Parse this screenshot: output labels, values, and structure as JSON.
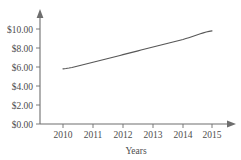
{
  "chart_data": {
    "type": "line",
    "title": "",
    "subtitle": "",
    "xlabel": "Years",
    "ylabel": "",
    "categories": [
      "2010",
      "2011",
      "2012",
      "2013",
      "2014",
      "2015"
    ],
    "x": [
      2010,
      2011,
      2012,
      2013,
      2014,
      2015
    ],
    "values": [
      5.8,
      6.5,
      7.3,
      8.1,
      8.9,
      9.8
    ],
    "series": [
      {
        "name": "Price",
        "values": [
          5.8,
          6.5,
          7.3,
          8.1,
          8.9,
          9.8
        ]
      }
    ],
    "ylim": [
      0,
      10
    ],
    "xlim": [
      2010,
      2015
    ],
    "y_ticks": [
      0,
      2,
      4,
      6,
      8,
      10
    ],
    "y_tick_labels": [
      "$0.00",
      "$2.00",
      "$4.00",
      "$6.00",
      "$8.00",
      "$10.00"
    ],
    "x_ticks": [
      2010,
      2011,
      2012,
      2013,
      2014,
      2015
    ],
    "x_tick_labels": [
      "2010",
      "2011",
      "2012",
      "2013",
      "2014",
      "2015"
    ],
    "grid": false,
    "legend": false,
    "legend_position": "none",
    "line_color": "#575757",
    "axis_color": "#6e6e6e",
    "background_color": "#ffffff",
    "annotations": []
  },
  "axes": {
    "y_labels": [
      {
        "text": "$10.00",
        "value": 10
      },
      {
        "text": "$8.00",
        "value": 8
      },
      {
        "text": "$6.00",
        "value": 6
      },
      {
        "text": "$4.00",
        "value": 4
      },
      {
        "text": "$2.00",
        "value": 2
      },
      {
        "text": "$0.00",
        "value": 0
      }
    ],
    "x_labels": [
      {
        "text": "2010",
        "value": 2010
      },
      {
        "text": "2011",
        "value": 2011
      },
      {
        "text": "2012",
        "value": 2012
      },
      {
        "text": "2013",
        "value": 2013
      },
      {
        "text": "2014",
        "value": 2014
      },
      {
        "text": "2015",
        "value": 2015
      }
    ],
    "x_axis_title": "Years",
    "y_axis_title": ""
  },
  "header": {
    "title": ""
  }
}
